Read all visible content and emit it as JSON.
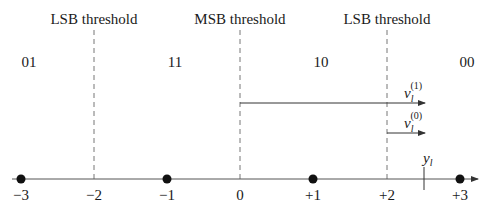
{
  "thresholds": [
    {
      "label": "LSB threshold",
      "x_value": -2
    },
    {
      "label": "MSB threshold",
      "x_value": 0
    },
    {
      "label": "LSB threshold",
      "x_value": 2
    }
  ],
  "regions": [
    {
      "bits": "01"
    },
    {
      "bits": "11"
    },
    {
      "bits": "10"
    },
    {
      "bits": "00"
    }
  ],
  "axis": {
    "ticks": [
      "−3",
      "−2",
      "−1",
      "0",
      "+1",
      "+2",
      "+3"
    ],
    "points": [
      "−3",
      "−1",
      "+1",
      "+3"
    ]
  },
  "vectors": [
    {
      "base": "ν",
      "sub": "l",
      "sup": "(1)"
    },
    {
      "base": "ν",
      "sub": "l",
      "sup": "(0)"
    }
  ],
  "received": {
    "base": "y",
    "sub": "l"
  }
}
